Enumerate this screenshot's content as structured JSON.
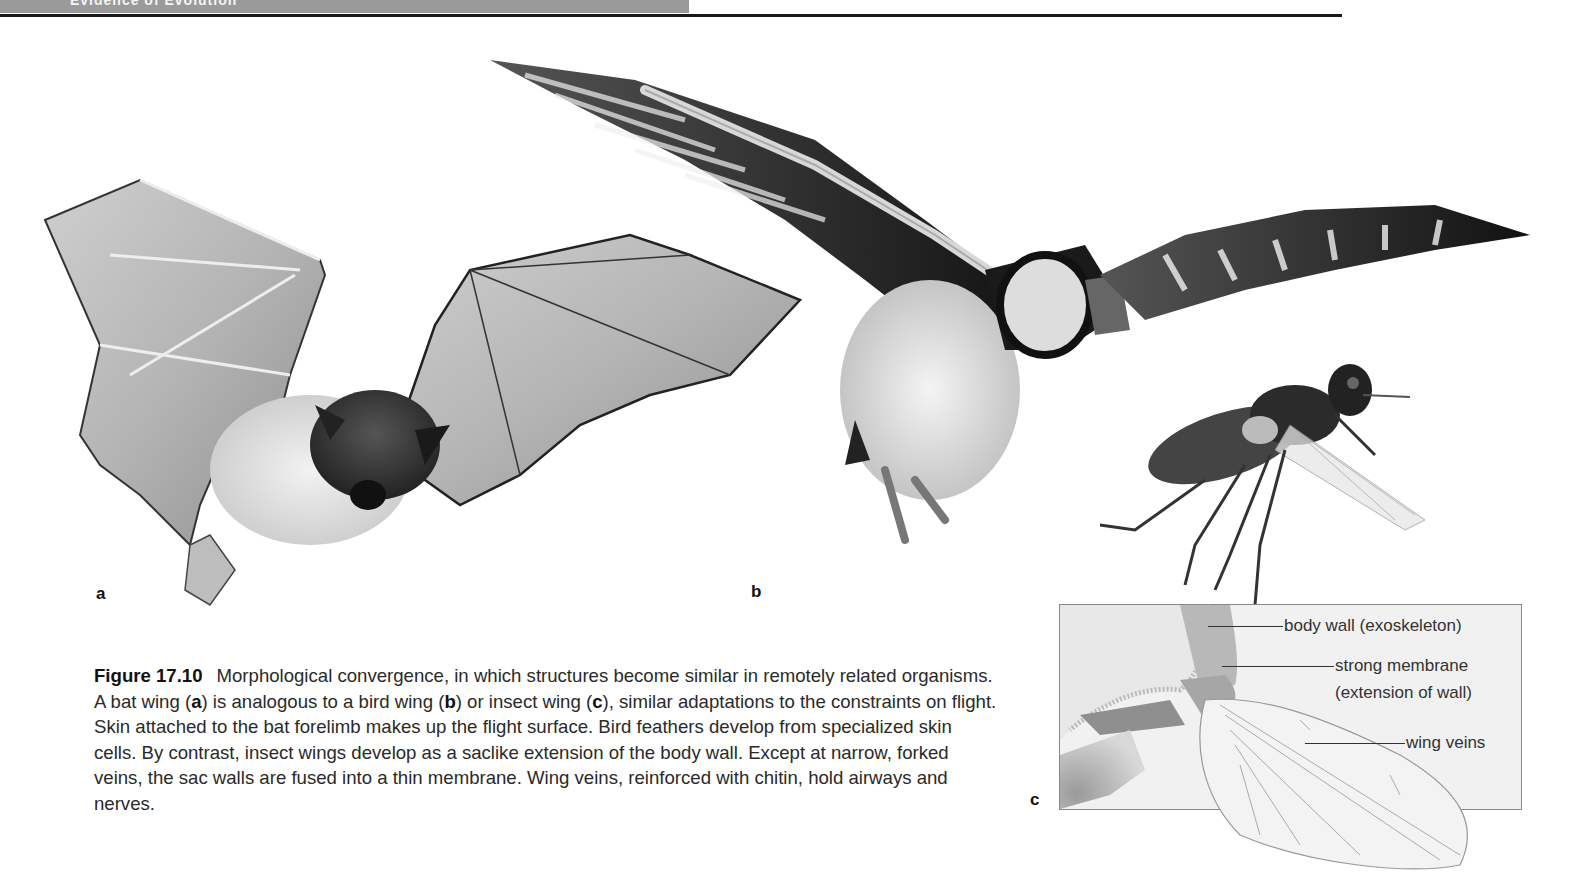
{
  "header": {
    "section_title": "Evidence of Evolution",
    "bar_color": "#9a9a9a",
    "rule_color": "#1a1a1a"
  },
  "figure": {
    "panels": [
      {
        "id": "a",
        "label": "a",
        "subject": "bat in flight (photo)"
      },
      {
        "id": "b",
        "label": "b",
        "subject": "puffin/bird in flight with wing bones overlay (photo)"
      },
      {
        "id": "c",
        "label": "c",
        "subject": "fly in flight (photo) and insect wing base diagram"
      }
    ],
    "diagram_c": {
      "callouts": [
        {
          "text": "body wall (exoskeleton)"
        },
        {
          "text": "strong membrane"
        },
        {
          "text": "(extension of wall)"
        },
        {
          "text": "wing veins"
        }
      ]
    },
    "caption": {
      "number": "Figure 17.10",
      "part1": "Morphological convergence, in which structures become similar in remotely related organisms. A bat wing (",
      "a": "a",
      "part2": ") is analogous to a bird wing (",
      "b": "b",
      "part3": ") or insect wing (",
      "c": "c",
      "part4": "), similar adaptations to the constraints on flight. Skin attached to the bat forelimb makes up the flight surface. Bird feathers develop from specialized skin cells. By contrast, insect wings develop as a saclike extension of the body wall. Except at narrow, forked veins, the sac walls are fused into a thin membrane. Wing veins, reinforced with chitin, hold airways and nerves."
    }
  }
}
